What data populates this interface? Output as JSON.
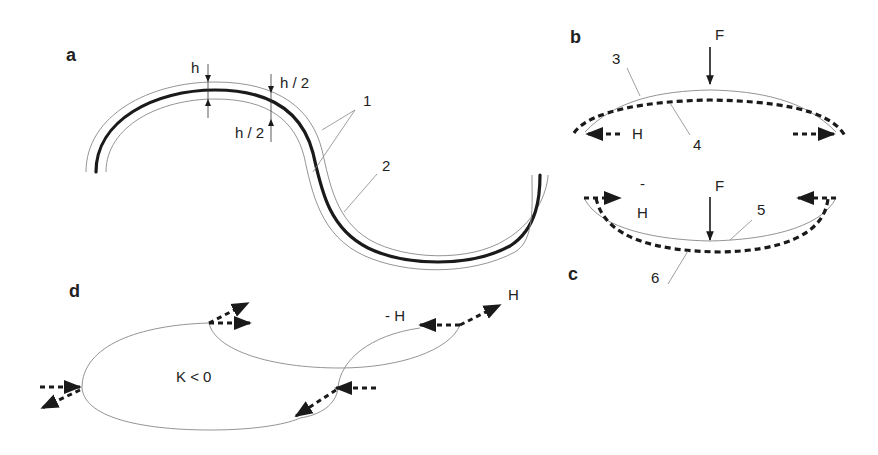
{
  "figure": {
    "panels": {
      "a": {
        "label": "a",
        "dimension_labels": {
          "h": "h",
          "h_half_top": "h / 2",
          "h_half_bottom": "h / 2"
        },
        "callouts": {
          "one": "1",
          "two": "2"
        }
      },
      "b": {
        "label": "b",
        "force_label": "F",
        "horizontal_label": "H",
        "callouts": {
          "three": "3",
          "four": "4"
        }
      },
      "c": {
        "label": "c",
        "force_label": "F",
        "horizontal_label_minus": "-",
        "horizontal_label": "H",
        "callouts": {
          "five": "5",
          "six": "6"
        }
      },
      "d": {
        "label": "d",
        "curvature_label": "K < 0",
        "minus_h_label": "- H",
        "h_label": "H"
      }
    },
    "colors": {
      "thin_line": "#888888",
      "thick_line": "#1a1a1a",
      "text": "#222222",
      "background": "#ffffff"
    }
  }
}
